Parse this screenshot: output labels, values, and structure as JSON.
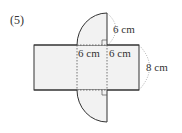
{
  "problem_number": "(5)",
  "labels": {
    "top_arc_radius": "6 cm",
    "left_segment": "6 cm",
    "right_segment": "6 cm",
    "height": "8 cm"
  },
  "colors": {
    "fill": "#f2f2f2",
    "stroke": "#333333",
    "dashed": "#555555"
  }
}
